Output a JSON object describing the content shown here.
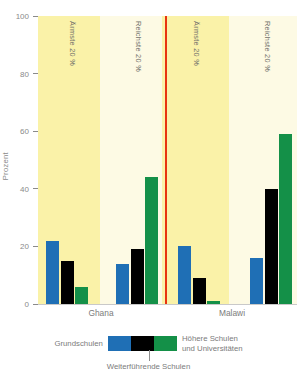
{
  "chart_data": {
    "type": "bar",
    "title": "",
    "xlabel": "",
    "ylabel": "Prozent",
    "ylim": [
      0,
      100
    ],
    "yticks": [
      0,
      20,
      40,
      60,
      80,
      100
    ],
    "grid": false,
    "legend_position": "bottom",
    "groups": [
      {
        "country": "Ghana",
        "quintile": "Ärmste 20 %",
        "values": [
          22,
          15,
          6
        ]
      },
      {
        "country": "Ghana",
        "quintile": "Reichste 20 %",
        "values": [
          14,
          19,
          44
        ]
      },
      {
        "country": "Malawi",
        "quintile": "Ärmste 20 %",
        "values": [
          20,
          9,
          1
        ]
      },
      {
        "country": "Malawi",
        "quintile": "Reichste 20 %",
        "values": [
          16,
          40,
          59
        ]
      }
    ],
    "series": [
      {
        "name": "Grundschulen",
        "color": "#1f6fb5",
        "values": [
          22,
          14,
          20,
          16
        ]
      },
      {
        "name": "Weiterführende Schulen",
        "color": "#000000",
        "values": [
          15,
          19,
          9,
          40
        ]
      },
      {
        "name": "Höhere Schulen und Universitäten",
        "color": "#149048",
        "values": [
          6,
          44,
          1,
          59
        ]
      }
    ],
    "categories": [
      "Ghana Ärmste 20 %",
      "Ghana Reichste 20 %",
      "Malawi Ärmste 20 %",
      "Malawi Reichste 20 %"
    ],
    "countries": [
      "Ghana",
      "Malawi"
    ],
    "band_labels": [
      "Ärmste 20 %",
      "Reichste 20 %",
      "Ärmste 20 %",
      "Reichste 20 %"
    ],
    "colors": {
      "primary_school": "#1f6fb5",
      "secondary_school": "#000000",
      "higher_education": "#149048",
      "band_poorest": "#faf2a8",
      "band_richest": "#fdfae4",
      "divider": "#e8330f",
      "axis_text": "#8a8a8a"
    }
  },
  "axis": {
    "y_label": "Prozent",
    "y_ticks": [
      "0",
      "20",
      "40",
      "60",
      "80",
      "100"
    ]
  },
  "countries": {
    "left": "Ghana",
    "right": "Malawi"
  },
  "bands": [
    {
      "label": "Ärmste 20 %"
    },
    {
      "label": "Reichste 20 %"
    },
    {
      "label": "Ärmste 20 %"
    },
    {
      "label": "Reichste 20 %"
    }
  ],
  "legend": {
    "left_label": "Grundschulen",
    "right_label": "Höhere Schulen\nund Universitäten",
    "right_label_line1": "Höhere Schulen",
    "right_label_line2": "und Universitäten",
    "bottom_label": "Weiterführende Schulen"
  },
  "header": {
    "clipped_text": ""
  }
}
